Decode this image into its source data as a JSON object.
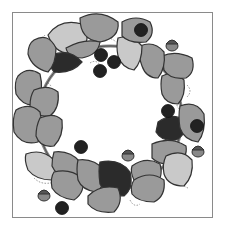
{
  "illustration": {
    "subject": "wreath",
    "style": "grayscale clip-art",
    "colors": {
      "background": "#ffffff",
      "frame": "#8a8a8a",
      "outline": "#333333",
      "leaf_mid": "#9a9a9a",
      "leaf_light": "#c9c9c9",
      "leaf_dark": "#2b2b2b",
      "berry": "#222222",
      "acorn_cap": "#555555",
      "acorn_nut": "#888888",
      "vine": "#888888",
      "dotted_tendril": "#777777"
    }
  }
}
